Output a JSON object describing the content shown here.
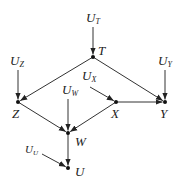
{
  "diagram": {
    "type": "causal-graph",
    "nodes": [
      {
        "id": "T",
        "label": "T",
        "x": 93,
        "y": 57,
        "lx": 98,
        "ly": 55
      },
      {
        "id": "Z",
        "label": "Z",
        "x": 18,
        "y": 102,
        "lx": 12,
        "ly": 118
      },
      {
        "id": "X",
        "label": "X",
        "x": 116,
        "y": 102,
        "lx": 111,
        "ly": 118
      },
      {
        "id": "Y",
        "label": "Y",
        "x": 165,
        "y": 102,
        "lx": 160,
        "ly": 118
      },
      {
        "id": "W",
        "label": "W",
        "x": 68,
        "y": 133,
        "lx": 75,
        "ly": 146
      },
      {
        "id": "U",
        "label": "U",
        "x": 68,
        "y": 168,
        "lx": 75,
        "ly": 176
      }
    ],
    "exogenous": [
      {
        "id": "UT",
        "label": "U",
        "sub": "T",
        "x": 86,
        "y": 22,
        "to": "T"
      },
      {
        "id": "UZ",
        "label": "U",
        "sub": "Z",
        "x": 10,
        "y": 65,
        "to": "Z"
      },
      {
        "id": "UY",
        "label": "U",
        "sub": "Y",
        "x": 158,
        "y": 65,
        "to": "Y"
      },
      {
        "id": "UX",
        "label": "U",
        "sub": "X",
        "x": 82,
        "y": 80,
        "to": "X"
      },
      {
        "id": "UW",
        "label": "U",
        "sub": "W",
        "x": 62,
        "y": 94,
        "to": "W"
      },
      {
        "id": "UU",
        "label": "U",
        "sub": "U",
        "x": 25,
        "y": 153,
        "to": "U"
      }
    ],
    "edges": [
      {
        "from": "UT",
        "to": "T",
        "x1": 93,
        "y1": 27,
        "x2": 93,
        "y2": 57
      },
      {
        "from": "UZ",
        "to": "Z",
        "x1": 18,
        "y1": 70,
        "x2": 18,
        "y2": 102
      },
      {
        "from": "UY",
        "to": "Y",
        "x1": 165,
        "y1": 70,
        "x2": 165,
        "y2": 102
      },
      {
        "from": "UX",
        "to": "X",
        "x1": 90,
        "y1": 87,
        "x2": 116,
        "y2": 102
      },
      {
        "from": "UW",
        "to": "W",
        "x1": 68,
        "y1": 99,
        "x2": 68,
        "y2": 133
      },
      {
        "from": "UU",
        "to": "U",
        "x1": 42,
        "y1": 154,
        "x2": 68,
        "y2": 168
      },
      {
        "from": "T",
        "to": "Z",
        "x1": 93,
        "y1": 57,
        "x2": 18,
        "y2": 102
      },
      {
        "from": "T",
        "to": "Y",
        "x1": 93,
        "y1": 57,
        "x2": 165,
        "y2": 102
      },
      {
        "from": "X",
        "to": "Y",
        "x1": 116,
        "y1": 102,
        "x2": 165,
        "y2": 102
      },
      {
        "from": "Z",
        "to": "W",
        "x1": 18,
        "y1": 102,
        "x2": 68,
        "y2": 133
      },
      {
        "from": "X",
        "to": "W",
        "x1": 116,
        "y1": 102,
        "x2": 68,
        "y2": 133
      },
      {
        "from": "W",
        "to": "U",
        "x1": 68,
        "y1": 133,
        "x2": 68,
        "y2": 168
      }
    ],
    "colors": {
      "line": "#333333",
      "node": "#111111",
      "text": "#222222"
    }
  }
}
